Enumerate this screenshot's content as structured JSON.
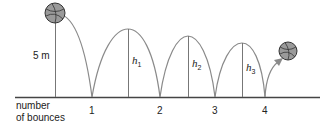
{
  "diagram": {
    "initial_height_label": "5 m",
    "axis_label_line1": "number",
    "axis_label_line2": "of bounces",
    "bounce_labels": [
      "1",
      "2",
      "3",
      "4"
    ],
    "height_labels": [
      {
        "var": "h",
        "sub": "1"
      },
      {
        "var": "h",
        "sub": "2"
      },
      {
        "var": "h",
        "sub": "3"
      }
    ],
    "colors": {
      "curve": "#8a8a8a",
      "baseline": "#444444",
      "ball_fill": "#9a9a9a",
      "ball_stroke": "#333333",
      "text": "#222222"
    }
  }
}
